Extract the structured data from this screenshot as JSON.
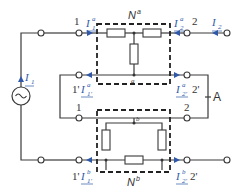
{
  "diagram": {
    "type": "two-port circuit (series-parallel interconnection)",
    "networks": {
      "top": {
        "name": "N",
        "sup": "a",
        "internal_node": "a"
      },
      "bottom": {
        "name": "N",
        "sup": "b",
        "internal_node": "b"
      }
    },
    "ports": {
      "top_left": "1",
      "top_left_return": "1'",
      "top_right": "2",
      "top_right_return": "2'",
      "bottom_left": "1",
      "bottom_left_return": "1'",
      "bottom_right": "2",
      "bottom_right_return": "2'"
    },
    "currents": {
      "I1": {
        "base": "I",
        "sub": "1"
      },
      "I2": {
        "base": "I",
        "sub": "2"
      },
      "Ia1": {
        "base": "I",
        "sup": "a",
        "sub": "1"
      },
      "Ia2": {
        "base": "I",
        "sup": "a",
        "sub": "2"
      },
      "Ia1p": {
        "base": "I",
        "sup": "a",
        "sub": "1'"
      },
      "Ia2p": {
        "base": "I",
        "sup": "a",
        "sub": "2'"
      },
      "Ib1p": {
        "base": "I",
        "sup": "b",
        "sub": "1'"
      },
      "Ib2p": {
        "base": "I",
        "sup": "b",
        "sub": "2'"
      }
    },
    "junction_label": "A",
    "source_symbol": "~",
    "colors": {
      "current": "#2f59a8",
      "wire": "#3a3a3a"
    }
  }
}
